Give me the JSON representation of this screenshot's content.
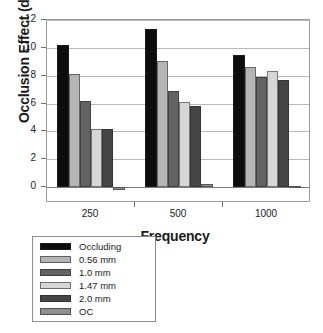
{
  "chart_data": {
    "type": "bar",
    "title": "",
    "xlabel": "Frequency",
    "ylabel": "Occlusion Effect (dB)",
    "categories": [
      "250",
      "500",
      "1000"
    ],
    "ylim": [
      0,
      12
    ],
    "yticks": [
      0,
      2,
      4,
      6,
      8,
      10,
      12
    ],
    "ytick_labels": [
      "0",
      "2",
      "4",
      "6",
      "8",
      "10",
      "12"
    ],
    "grid": true,
    "grid_axis": "y",
    "legend_position": "below-left-boxed",
    "series": [
      {
        "name": "Occluding",
        "color": "#0d0d0d",
        "values": [
          10.2,
          11.35,
          9.5
        ]
      },
      {
        "name": "0.56 mm",
        "color": "#b4b4b4",
        "values": [
          8.1,
          9.05,
          8.65
        ]
      },
      {
        "name": "1.0 mm",
        "color": "#636363",
        "values": [
          6.2,
          6.9,
          7.9
        ]
      },
      {
        "name": "1.47 mm",
        "color": "#d6d6d6",
        "values": [
          4.2,
          6.1,
          8.3
        ]
      },
      {
        "name": "2.0 mm",
        "color": "#454545",
        "values": [
          4.2,
          5.85,
          7.7
        ]
      },
      {
        "name": "OC",
        "color": "#8f8f8f",
        "values": [
          -0.25,
          0.18,
          0.08
        ]
      }
    ]
  },
  "axes": {
    "frame_color": "#9a9a9a",
    "grid_color": "#b9b9b9",
    "zero_line_color": "#7b7b7b"
  }
}
